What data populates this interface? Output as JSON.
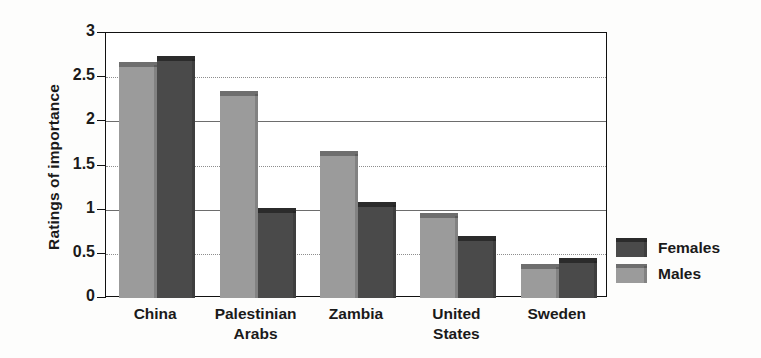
{
  "chart_data": {
    "type": "bar",
    "title": "",
    "subtitle": "",
    "xlabel": "",
    "ylabel": "Ratings of importance",
    "ylim": [
      0,
      3
    ],
    "ytick_labels": [
      "0",
      "0.5",
      "1",
      "1.5",
      "2",
      "2.5",
      "3"
    ],
    "ytick_values": [
      0,
      0.5,
      1,
      1.5,
      2,
      2.5,
      3
    ],
    "grid": true,
    "grid_axis": "y",
    "legend_position": "right",
    "categories": [
      "China",
      "Palestinian\nArabs",
      "Zambia",
      "United\nStates",
      "Sweden"
    ],
    "category_plain": [
      "China",
      "Palestinian Arabs",
      "Zambia",
      "United States",
      "Sweden"
    ],
    "series": [
      {
        "name": "Males",
        "color": "#9b9b9b",
        "top_color": "#6e6e6e",
        "values": [
          2.6,
          2.28,
          1.6,
          0.89,
          0.32
        ]
      },
      {
        "name": "Females",
        "color": "#4a4a4a",
        "top_color": "#2b2b2b",
        "values": [
          2.67,
          0.95,
          1.02,
          0.63,
          0.385
        ]
      }
    ],
    "legend_order": [
      "Females",
      "Males"
    ]
  },
  "legend": {
    "items": [
      {
        "label": "Females"
      },
      {
        "label": "Males"
      }
    ]
  },
  "axis": {
    "y_title": "Ratings of importance"
  }
}
